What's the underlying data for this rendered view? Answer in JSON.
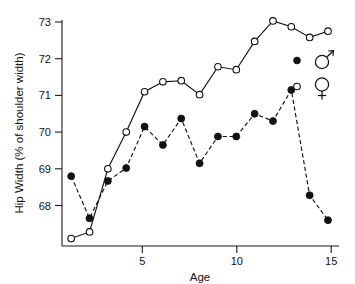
{
  "chart_data": {
    "type": "line",
    "title": "",
    "subtitle": "",
    "xlabel": "Age",
    "ylabel": "Hip Width (% of shoulder width)",
    "xlim": [
      0.5,
      15.6
    ],
    "ylim": [
      66.85,
      73.25
    ],
    "grid": false,
    "x": [
      1,
      2,
      3,
      4,
      5,
      6,
      7,
      8,
      9,
      10,
      11,
      12,
      13,
      14,
      15
    ],
    "xticks": [
      5,
      10,
      15
    ],
    "xticklabels": [
      "5",
      "10",
      "15"
    ],
    "yticks": [
      68,
      69,
      70,
      71,
      72,
      73
    ],
    "yticklabels": [
      "68",
      "69",
      "70",
      "71",
      "72",
      "73"
    ],
    "legend_position": "inside-right",
    "series": [
      {
        "name": "male",
        "symbol": "filled-circle",
        "linestyle": "dashed",
        "color": "#111111",
        "values": [
          68.8,
          67.65,
          68.67,
          69.02,
          70.15,
          69.65,
          70.37,
          69.15,
          69.88,
          69.88,
          70.5,
          70.3,
          71.15,
          68.28,
          67.6
        ]
      },
      {
        "name": "female",
        "symbol": "open-circle",
        "linestyle": "solid",
        "color": "#111111",
        "values": [
          67.1,
          67.28,
          69.0,
          70.0,
          71.1,
          71.37,
          71.4,
          71.02,
          71.78,
          71.7,
          72.47,
          73.03,
          72.87,
          72.58,
          72.75
        ]
      }
    ],
    "annotations": []
  },
  "axes": {
    "y_title": "Hip Width (% of shoulder width)",
    "x_title": "Age",
    "y_tick_68": "68",
    "y_tick_69": "69",
    "y_tick_70": "70",
    "y_tick_71": "71",
    "y_tick_72": "72",
    "y_tick_73": "73",
    "x_tick_5": "5",
    "x_tick_10": "10",
    "x_tick_15": "15"
  },
  "legend": {
    "entries": [
      {
        "symbol": "filled-circle",
        "glyph": "male-symbol",
        "label": "♂"
      },
      {
        "symbol": "open-circle",
        "glyph": "female-symbol",
        "label": "♀"
      }
    ]
  },
  "colors": {
    "background": "#ffffff",
    "ink": "#111111",
    "marker_fill_open": "#ffffff",
    "marker_fill_filled": "#111111"
  }
}
